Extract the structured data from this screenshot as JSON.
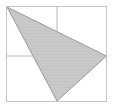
{
  "figure": {
    "canvas": {
      "width": 114,
      "height": 109,
      "background": "#ffffff"
    },
    "frame": {
      "name": "square-border",
      "x": 6.5,
      "y": 6.5,
      "width": 100,
      "height": 95,
      "stroke": "#c4c4c4",
      "stroke_width": 1,
      "fill": "#ffffff"
    },
    "grid": {
      "stroke": "#b8b8b8",
      "stroke_width": 1,
      "vertical_line": {
        "x": 57,
        "y1": 6.5,
        "y2": 101.5
      },
      "horizontal_line": {
        "y": 56,
        "x1": 6.5,
        "x2": 106.5
      }
    },
    "triangle": {
      "name": "shaded-triangle",
      "points": "7,7 106.5,56 57,101",
      "vertices": [
        {
          "label": "top-left-vertex",
          "x": 7,
          "y": 7
        },
        {
          "label": "right-vertex",
          "x": 106.5,
          "y": 56
        },
        {
          "label": "bottom-vertex",
          "x": 57,
          "y": 101
        }
      ],
      "fill": "#c9c9c9",
      "stroke": "#9a9a9a",
      "stroke_width": 1,
      "hatch": {
        "pattern": "horizontal-lines",
        "stroke": "#bdbdbd",
        "stroke_width": 0.6,
        "spacing": 3
      }
    }
  }
}
